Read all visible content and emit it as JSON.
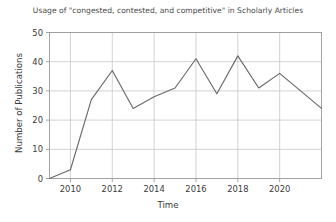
{
  "chart_data": {
    "type": "line",
    "title": "Usage of \"congested, contested, and competitive\" in Scholarly Articles",
    "xlabel": "Time",
    "ylabel": "Number of Publications",
    "x": [
      2009,
      2010,
      2011,
      2012,
      2013,
      2014,
      2015,
      2016,
      2017,
      2018,
      2019,
      2020,
      2021,
      2022
    ],
    "values": [
      0,
      3,
      27,
      37,
      24,
      28,
      31,
      41,
      29,
      42,
      31,
      36,
      30,
      24
    ],
    "series": [
      {
        "name": "Number of Publications",
        "values": [
          0,
          3,
          27,
          37,
          24,
          28,
          31,
          41,
          29,
          42,
          31,
          36,
          30,
          24
        ]
      }
    ],
    "xlim": [
      2009,
      2022
    ],
    "ylim": [
      0,
      50
    ],
    "x_ticks": [
      2010,
      2012,
      2014,
      2016,
      2018,
      2020
    ],
    "x_tick_labels": [
      "2010",
      "2012",
      "2014",
      "2016",
      "2018",
      "2020"
    ],
    "y_ticks": [
      0,
      10,
      20,
      30,
      40,
      50
    ],
    "y_tick_labels": [
      "0",
      "10",
      "20",
      "30",
      "40",
      "50"
    ],
    "grid": true,
    "legend": "none",
    "line_color": "#6a6a6a",
    "grid_color": "#c8c8c8",
    "axis_color": "#9a9a9a",
    "background_color": "#ffffff"
  }
}
